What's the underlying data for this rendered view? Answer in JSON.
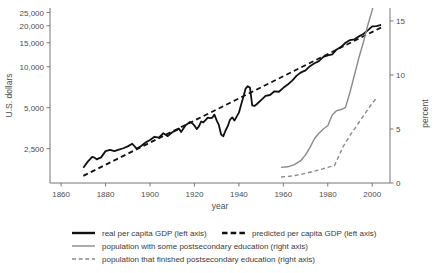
{
  "chart_data": {
    "type": "line",
    "title": "",
    "xlabel": "year",
    "ylabel_left": "U.S. dollars",
    "ylabel_right": "percent",
    "grid": false,
    "legend_position": "bottom",
    "x_axis": {
      "label": "year",
      "min": 1855,
      "max": 2008,
      "ticks": [
        1860,
        1880,
        1900,
        1920,
        1940,
        1960,
        1980,
        2000
      ],
      "tick_labels": [
        "1860",
        "1880",
        "1900",
        "1920",
        "1940",
        "1960",
        "1980",
        "2000"
      ]
    },
    "y_axis_left": {
      "label": "U.S. dollars",
      "scale": "log",
      "min": 1400,
      "max": 27000,
      "ticks": [
        2500,
        5000,
        10000,
        15000,
        20000,
        25000
      ],
      "tick_labels": [
        "2,500",
        "5,000",
        "10,000",
        "15,000",
        "20,000",
        "25,000"
      ]
    },
    "y_axis_right": {
      "label": "percent",
      "scale": "linear",
      "min": 0,
      "max": 16.2,
      "ticks": [
        0,
        5,
        10,
        15
      ],
      "tick_labels": [
        "0",
        "5",
        "10",
        "15"
      ]
    },
    "series": [
      {
        "name": "real per capita GDP (left axis)",
        "axis": "left",
        "style": "solid",
        "color": "#111111",
        "width": 1.8,
        "x": [
          1870,
          1872,
          1874,
          1875,
          1876,
          1878,
          1880,
          1882,
          1884,
          1886,
          1888,
          1890,
          1892,
          1894,
          1896,
          1898,
          1900,
          1902,
          1904,
          1906,
          1908,
          1910,
          1912,
          1913,
          1914,
          1916,
          1918,
          1919,
          1920,
          1921,
          1922,
          1923,
          1924,
          1925,
          1926,
          1927,
          1928,
          1929,
          1930,
          1931,
          1932,
          1933,
          1934,
          1935,
          1936,
          1937,
          1938,
          1939,
          1940,
          1941,
          1942,
          1943,
          1944,
          1945,
          1946,
          1947,
          1948,
          1950,
          1952,
          1954,
          1956,
          1958,
          1960,
          1962,
          1964,
          1966,
          1968,
          1970,
          1972,
          1974,
          1976,
          1978,
          1980,
          1982,
          1984,
          1986,
          1988,
          1990,
          1992,
          1994,
          1996,
          1998,
          2000,
          2002,
          2004
        ],
        "y": [
          1810,
          2010,
          2180,
          2150,
          2090,
          2160,
          2400,
          2450,
          2400,
          2460,
          2520,
          2600,
          2720,
          2500,
          2620,
          2780,
          2900,
          3060,
          3010,
          3250,
          3090,
          3300,
          3420,
          3520,
          3320,
          3720,
          3930,
          3850,
          3700,
          3480,
          3650,
          3960,
          3900,
          4050,
          4230,
          4200,
          4220,
          4450,
          4040,
          3720,
          3180,
          3090,
          3400,
          3660,
          4080,
          4250,
          4020,
          4300,
          4600,
          5250,
          6000,
          6900,
          7200,
          7000,
          5200,
          5150,
          5300,
          5680,
          6100,
          6200,
          6600,
          6550,
          7000,
          7400,
          7900,
          8600,
          9100,
          9400,
          10100,
          10600,
          11000,
          11800,
          12100,
          12300,
          13400,
          14000,
          15000,
          15700,
          15900,
          16700,
          17400,
          18500,
          19800,
          19900,
          20300
        ]
      },
      {
        "name": "predicted per capita GDP (left axis)",
        "axis": "left",
        "style": "dashed",
        "color": "#111111",
        "width": 1.8,
        "x": [
          1870,
          2004
        ],
        "y": [
          1580,
          19400
        ]
      },
      {
        "name": "population with some postsecondary education (right axis)",
        "axis": "right",
        "style": "solid",
        "color": "#8a8a8a",
        "width": 1.4,
        "x": [
          1959,
          1962,
          1965,
          1968,
          1970,
          1972,
          1974,
          1976,
          1978,
          1980,
          1982,
          1984,
          1986,
          1988,
          1990,
          1992,
          1994,
          1996,
          1998,
          2000,
          2002
        ],
        "y": [
          1.45,
          1.5,
          1.7,
          2.1,
          2.6,
          3.3,
          4.1,
          4.6,
          5.0,
          5.3,
          6.3,
          6.7,
          6.8,
          7.0,
          8.4,
          10.0,
          11.6,
          13.0,
          14.6,
          16.0,
          17.6
        ]
      },
      {
        "name": "population that finished postsecondary education (right axis)",
        "axis": "right",
        "style": "dashed",
        "color": "#8a8a8a",
        "width": 1.4,
        "x": [
          1959,
          1964,
          1968,
          1972,
          1976,
          1980,
          1983,
          1985,
          1987,
          1990,
          1993,
          1996,
          1999,
          2002
        ],
        "y": [
          0.55,
          0.65,
          0.8,
          1.0,
          1.2,
          1.45,
          1.6,
          2.5,
          3.4,
          4.4,
          5.3,
          6.2,
          7.1,
          7.9
        ]
      }
    ],
    "legend": [
      {
        "label": "real per capita GDP (left axis)",
        "style": "solid",
        "color": "#111111",
        "width": 2.4
      },
      {
        "label": "predicted per capita GDP (left axis)",
        "style": "dashed",
        "color": "#111111",
        "width": 2.4
      },
      {
        "label": "population with some postsecondary education (right axis)",
        "style": "solid",
        "color": "#8a8a8a",
        "width": 1.4
      },
      {
        "label": "population that finished postsecondary education (right axis)",
        "style": "dashed",
        "color": "#8a8a8a",
        "width": 1.4
      }
    ]
  }
}
